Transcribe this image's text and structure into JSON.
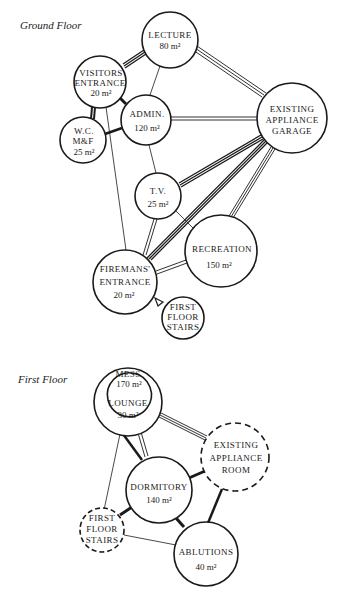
{
  "ground_floor": {
    "title": "Ground Floor",
    "nodes": {
      "lecture": {
        "lines": [
          "LECTURE"
        ],
        "area": "80 m²"
      },
      "visitors": {
        "lines": [
          "VISITORS",
          "ENTRANCE"
        ],
        "area": "20 m²"
      },
      "admin": {
        "lines": [
          "ADMIN."
        ],
        "area": "120 m²"
      },
      "wc": {
        "lines": [
          "W.C.",
          "M&F"
        ],
        "area": "25 m²"
      },
      "garage": {
        "lines": [
          "EXISTING",
          "APPLIANCE",
          "GARAGE"
        ],
        "area": ""
      },
      "tv": {
        "lines": [
          "T.V."
        ],
        "area": "25 m²"
      },
      "recreation": {
        "lines": [
          "RECREATION"
        ],
        "area": "150 m²"
      },
      "firemans": {
        "lines": [
          "FIREMANS'",
          "ENTRANCE"
        ],
        "area": "20 m²"
      },
      "stairs": {
        "lines": [
          "FIRST",
          "FLOOR",
          "STAIRS"
        ],
        "area": ""
      }
    }
  },
  "first_floor": {
    "title": "First Floor",
    "nodes": {
      "mess": {
        "lines": [
          "MESS"
        ],
        "area": "170 m²"
      },
      "lounge": {
        "lines": [
          "LOUNGE"
        ],
        "area": "30 m²"
      },
      "room": {
        "lines": [
          "EXISTING",
          "APPLIANCE",
          "ROOM"
        ],
        "area": ""
      },
      "dormitory": {
        "lines": [
          "DORMITORY"
        ],
        "area": "140 m²"
      },
      "stairs": {
        "lines": [
          "FIRST",
          "FLOOR",
          "STAIRS"
        ],
        "area": ""
      },
      "ablutions": {
        "lines": [
          "ABLUTIONS"
        ],
        "area": "40 m²"
      }
    }
  },
  "colors": {
    "ink": "#1a1a1a",
    "background": "#ffffff"
  }
}
